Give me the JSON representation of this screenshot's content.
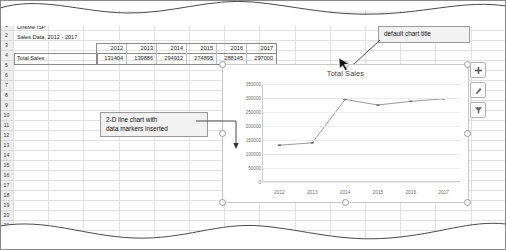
{
  "app": {
    "type": "spreadsheet",
    "column_headers": [
      "A",
      "B",
      "C",
      "D",
      "E",
      "F",
      "G",
      "H",
      "I",
      "J",
      "K",
      "L",
      "M",
      "N"
    ],
    "visible_column_letters": [
      "A",
      "B",
      "F",
      "G",
      "H",
      "L",
      "M",
      "N"
    ],
    "row_numbers": [
      "1",
      "2",
      "3",
      "4",
      "5",
      "6",
      "7",
      "8",
      "9",
      "10",
      "11",
      "12",
      "13",
      "14",
      "15",
      "16",
      "17",
      "18",
      "19",
      "20",
      "21",
      "22"
    ]
  },
  "sheet": {
    "title_cell": "LinkMe ISP",
    "subtitle_cell": "Sales Data, 2012 - 2017",
    "row_label": "Total Sales",
    "year_headers": [
      "2012",
      "2013",
      "2014",
      "2015",
      "2016",
      "2017"
    ],
    "values": [
      "131404",
      "139886",
      "294912",
      "274895",
      "288145",
      "297000"
    ],
    "values_obscured_note": [
      "2016",
      "2017"
    ]
  },
  "chart_data": {
    "type": "line",
    "title": "Total Sales",
    "categories": [
      "2012",
      "2013",
      "2014",
      "2015",
      "2016",
      "2017"
    ],
    "values": [
      131404,
      139886,
      294912,
      274895,
      288145,
      297000
    ],
    "series": [
      {
        "name": "Total Sales",
        "values": [
          131404,
          139886,
          294912,
          274895,
          288145,
          297000
        ]
      }
    ],
    "ylim": [
      0,
      350000
    ],
    "ytick_labels": [
      "0",
      "50000",
      "100000",
      "150000",
      "200000",
      "250000",
      "300000",
      "350000"
    ],
    "ytick_values": [
      0,
      50000,
      100000,
      150000,
      200000,
      250000,
      300000,
      350000
    ],
    "xlabel": "",
    "ylabel": "",
    "grid": true,
    "legend": "none",
    "markers": true,
    "line_color": "#7f7f7f",
    "marker_color": "#6e6e6e",
    "gridline_color": "#ebebeb"
  },
  "chart_object": {
    "selected": true,
    "buttons": [
      {
        "name": "chart-elements",
        "glyph": "+"
      },
      {
        "name": "chart-styles",
        "glyph": "brush"
      },
      {
        "name": "chart-filters",
        "glyph": "funnel"
      }
    ]
  },
  "annotations": {
    "chart_title_callout": "default chart title",
    "chart_type_callout_line1": "2-D line chart with",
    "chart_type_callout_line2": "data markers inserted"
  },
  "colors": {
    "header_bg": "#efefef",
    "gridline": "#e2e2e2",
    "callout_bg": "#f2f2f2",
    "border": "#8a8a8a"
  }
}
